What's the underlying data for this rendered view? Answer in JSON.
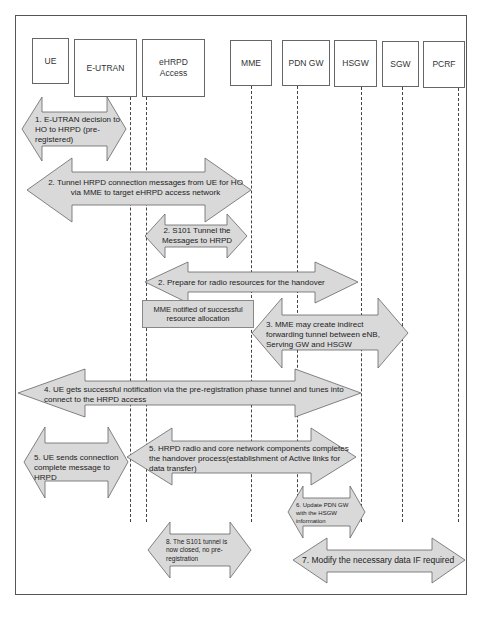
{
  "diagram": {
    "type": "sequence-diagram",
    "colors": {
      "arrow_fill": "#d9d9d9",
      "arrow_stroke": "#666666",
      "frame": "#555555"
    },
    "entities": [
      {
        "id": "ue",
        "label": "UE"
      },
      {
        "id": "eutran",
        "label": "E-UTRAN"
      },
      {
        "id": "ehrpd",
        "label": "eHRPD\nAccess"
      },
      {
        "id": "mme",
        "label": "MME"
      },
      {
        "id": "pdngw",
        "label": "PDN GW"
      },
      {
        "id": "hsgw",
        "label": "HSGW"
      },
      {
        "id": "sgw",
        "label": "SGW"
      },
      {
        "id": "pcrf",
        "label": "PCRF"
      }
    ],
    "steps": [
      {
        "id": "s1",
        "text": "1. E-UTRAN decision to HO to HRPD (pre-registered)"
      },
      {
        "id": "s2a",
        "text": "2. Tunnel HRPD connection messages from UE for HO via MME to target eHRPD access network"
      },
      {
        "id": "s2b",
        "text": "2. S101 Tunnel  the Messages to HRPD"
      },
      {
        "id": "s2c",
        "text": "2. Prepare for radio resources for the handover"
      },
      {
        "id": "note",
        "text": "MME notified of successful resource allocation"
      },
      {
        "id": "s3",
        "text": "3. MME may create indirect forwarding tunnel between eNB, Serving GW and HSGW"
      },
      {
        "id": "s4",
        "text": "4. UE gets successful notification via the pre-registration phase tunnel and tunes into connect to the HRPD access"
      },
      {
        "id": "s5a",
        "text": "5. UE sends connection complete message to HRPD"
      },
      {
        "id": "s5b",
        "text": "5. HRPD radio and core network components completes the handover process(establishment of Active links for data transfer)"
      },
      {
        "id": "s6",
        "text": "6. Update PDN GW with the HSGW information"
      },
      {
        "id": "s8",
        "text": "8. The S101 tunnel is now closed, no pre-registration"
      },
      {
        "id": "s7",
        "text": "7. Modify the necessary data IF required"
      }
    ]
  }
}
